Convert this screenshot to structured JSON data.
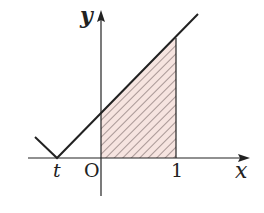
{
  "diagram": {
    "axes": {
      "x_label": "x",
      "y_label": "y",
      "origin_label": "O"
    },
    "ticks": {
      "t_label": "t",
      "one_label": "1"
    },
    "function": "y = |x - t|",
    "shaded_region": {
      "from": "0",
      "to": "1",
      "description": "area under y=|x-t| between x=0 and x=1"
    },
    "colors": {
      "line": "#222222",
      "hatch": "#5a4a4a",
      "fill": "#f6e4e0"
    }
  }
}
